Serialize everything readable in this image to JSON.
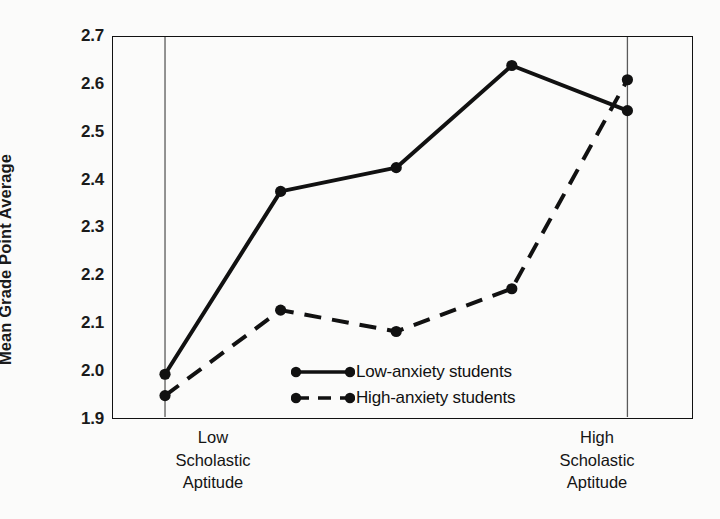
{
  "chart_data": {
    "type": "line",
    "title": "",
    "subtitle": "",
    "xlabel": "",
    "ylabel": "Mean Grade Point Average",
    "categories": [
      "Low Scholastic Aptitude",
      "2",
      "3",
      "4",
      "High Scholastic Aptitude"
    ],
    "x": [
      1,
      2,
      3,
      4,
      5
    ],
    "xlim": [
      0.55,
      5.55
    ],
    "ylim": [
      1.9,
      2.7
    ],
    "yticks": [
      "2.7",
      "2.6",
      "2.5",
      "2.4",
      "2.3",
      "2.2",
      "2.1",
      "2.0",
      "1.9"
    ],
    "ytick_values": [
      2.7,
      2.6,
      2.5,
      2.4,
      2.3,
      2.2,
      2.1,
      2.0,
      1.9
    ],
    "grid": false,
    "vertical_reference_lines": [
      1,
      5
    ],
    "legend_position": "center-bottom-inside",
    "series": [
      {
        "name": "Low-anxiety students",
        "style": "solid",
        "marker": "filled-circle",
        "color": "#111111",
        "values": [
          1.99,
          2.375,
          2.425,
          2.64,
          2.545
        ]
      },
      {
        "name": "High-anxiety students",
        "style": "dashed",
        "marker": "filled-circle",
        "color": "#111111",
        "values": [
          1.945,
          2.125,
          2.08,
          2.17,
          2.61
        ]
      }
    ],
    "axis_tick_labels_x": [
      {
        "position": 1,
        "lines": [
          "Low",
          "Scholastic",
          "Aptitude"
        ]
      },
      {
        "position": 5,
        "lines": [
          "High",
          "Scholastic",
          "Aptitude"
        ]
      }
    ]
  },
  "legend": {
    "items": [
      {
        "label": "Low-anxiety students",
        "style": "solid"
      },
      {
        "label": "High-anxiety students",
        "style": "dashed"
      }
    ]
  },
  "axes": {
    "y_title": "Mean Grade Point Average",
    "y_ticks": [
      "2.7",
      "2.6",
      "2.5",
      "2.4",
      "2.3",
      "2.2",
      "2.1",
      "2.0",
      "1.9"
    ],
    "x_left_label_line1": "Low",
    "x_left_label_line2": "Scholastic",
    "x_left_label_line3": "Aptitude",
    "x_right_label_line1": "High",
    "x_right_label_line2": "Scholastic",
    "x_right_label_line3": "Aptitude"
  },
  "colors": {
    "ink": "#111111",
    "paper": "#fbfbfa",
    "gridline": "#5a5a5a"
  }
}
